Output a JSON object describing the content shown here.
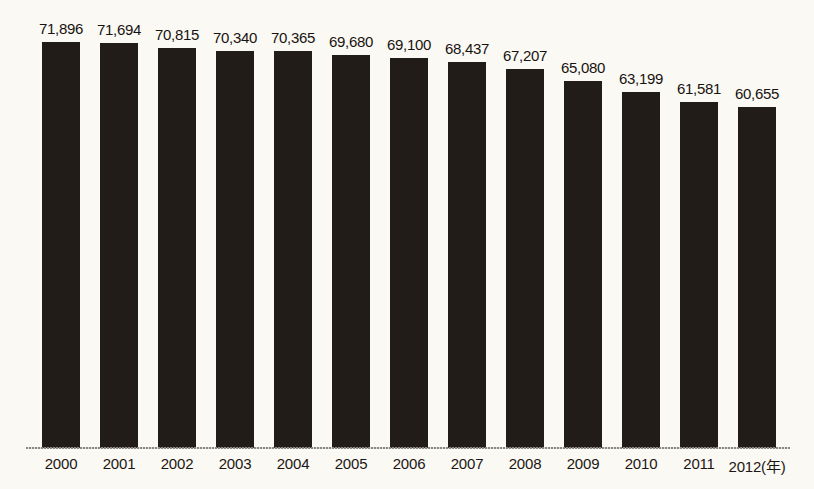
{
  "chart_data": {
    "type": "bar",
    "title": "",
    "subtitle": "",
    "xlabel": "年",
    "ylabel": "",
    "grid": false,
    "legend": null,
    "axis_unit_note": "(年)",
    "categories": [
      "2000",
      "2001",
      "2002",
      "2003",
      "2004",
      "2005",
      "2006",
      "2007",
      "2008",
      "2009",
      "2010",
      "2011",
      "2012"
    ],
    "tick_labels": [
      "2000",
      "2001",
      "2002",
      "2003",
      "2004",
      "2005",
      "2006",
      "2007",
      "2008",
      "2009",
      "2010",
      "2011",
      "2012(年)"
    ],
    "values": [
      71896,
      71694,
      70815,
      70340,
      70365,
      69680,
      69100,
      68437,
      67207,
      65080,
      63199,
      61581,
      60655
    ],
    "value_labels": [
      "71,896",
      "71,694",
      "70,815",
      "70,340",
      "70,365",
      "69,680",
      "69,100",
      "68,437",
      "67,207",
      "65,080",
      "63,199",
      "61,581",
      "60,655"
    ],
    "bar_color": "#221c18",
    "background_color": "#fbf9f4",
    "axis_color": "#8d8880",
    "text_color": "#1b1612",
    "ylim": [
      55000,
      73000
    ]
  }
}
